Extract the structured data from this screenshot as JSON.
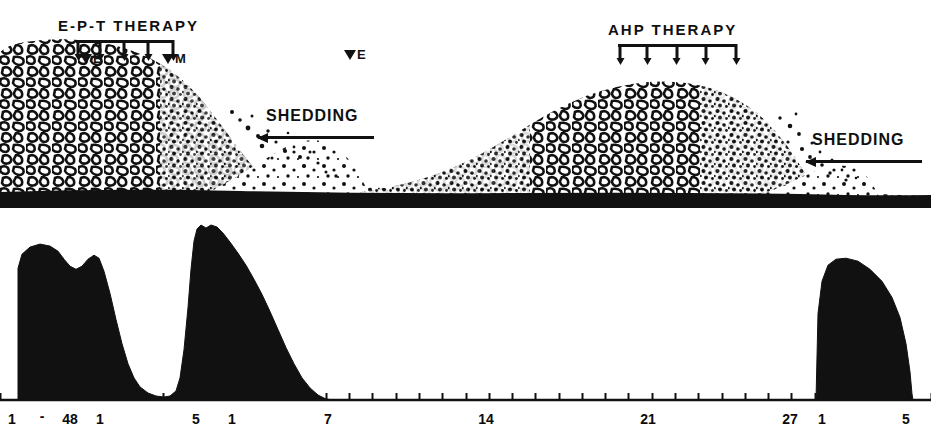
{
  "figure": {
    "title_hidden": "Vegetation mass and bacteremia time course",
    "ink_color": "#111111",
    "background_color": "#ffffff"
  },
  "annotations": {
    "therapy_left": {
      "label": "E-P-T THERAPY",
      "dose_count": 5,
      "start_day": 1,
      "end_day": 5
    },
    "therapy_right": {
      "label": "AHP THERAPY",
      "dose_count": 5,
      "start_day": 14,
      "end_day": 18
    },
    "shedding_left": {
      "label": "SHEDDING"
    },
    "shedding_right": {
      "label": "SHEDDING"
    },
    "markers": [
      {
        "name": "marker-e-left",
        "symbol": "▼",
        "text": "E"
      },
      {
        "name": "marker-m-left",
        "symbol": "▼",
        "text": "M"
      },
      {
        "name": "marker-e-mid",
        "symbol": "▼",
        "text": "E"
      }
    ]
  },
  "axis": {
    "orientation": "horizontal",
    "tick_count": 41,
    "labels": [
      {
        "text": "1",
        "x": 12
      },
      {
        "text": "-",
        "x": 42
      },
      {
        "text": "48",
        "x": 70
      },
      {
        "text": "1",
        "x": 100
      },
      {
        "text": "5",
        "x": 196
      },
      {
        "text": "1",
        "x": 232
      },
      {
        "text": "7",
        "x": 328
      },
      {
        "text": "14",
        "x": 486
      },
      {
        "text": "21",
        "x": 648
      },
      {
        "text": "27",
        "x": 790
      },
      {
        "text": "1",
        "x": 822
      },
      {
        "text": "5",
        "x": 906
      }
    ]
  },
  "chart_data": {
    "type": "area",
    "title": "",
    "xlabel": "",
    "ylabel": "",
    "grid": false,
    "legend": "none",
    "xlim": [
      0,
      931
    ],
    "ylim": [
      0,
      175
    ],
    "series": [
      {
        "name": "bacteremia-profile",
        "fill": "#111111",
        "points": [
          [
            18,
            0
          ],
          [
            18,
            131
          ],
          [
            22,
            145
          ],
          [
            30,
            152
          ],
          [
            40,
            155
          ],
          [
            50,
            153
          ],
          [
            58,
            148
          ],
          [
            64,
            140
          ],
          [
            70,
            133
          ],
          [
            76,
            130
          ],
          [
            82,
            133
          ],
          [
            88,
            140
          ],
          [
            94,
            144
          ],
          [
            99,
            141
          ],
          [
            104,
            128
          ],
          [
            110,
            106
          ],
          [
            116,
            80
          ],
          [
            122,
            56
          ],
          [
            128,
            36
          ],
          [
            134,
            22
          ],
          [
            140,
            13
          ],
          [
            148,
            7
          ],
          [
            156,
            4
          ],
          [
            164,
            3
          ],
          [
            170,
            4
          ],
          [
            176,
            9
          ],
          [
            180,
            22
          ],
          [
            184,
            50
          ],
          [
            188,
            92
          ],
          [
            191,
            130
          ],
          [
            194,
            158
          ],
          [
            197,
            170
          ],
          [
            201,
            174
          ],
          [
            206,
            171
          ],
          [
            211,
            174
          ],
          [
            217,
            172
          ],
          [
            223,
            166
          ],
          [
            230,
            157
          ],
          [
            238,
            146
          ],
          [
            246,
            134
          ],
          [
            254,
            120
          ],
          [
            262,
            105
          ],
          [
            270,
            88
          ],
          [
            278,
            70
          ],
          [
            286,
            52
          ],
          [
            294,
            36
          ],
          [
            302,
            22
          ],
          [
            310,
            12
          ],
          [
            318,
            5
          ],
          [
            326,
            1
          ],
          [
            334,
            0
          ],
          [
            816,
            0
          ],
          [
            818,
            86
          ],
          [
            822,
            118
          ],
          [
            828,
            134
          ],
          [
            836,
            140
          ],
          [
            846,
            141
          ],
          [
            858,
            138
          ],
          [
            870,
            130
          ],
          [
            882,
            118
          ],
          [
            892,
            102
          ],
          [
            900,
            82
          ],
          [
            906,
            56
          ],
          [
            910,
            28
          ],
          [
            912,
            6
          ],
          [
            913,
            0
          ]
        ]
      }
    ]
  },
  "vegetation": {
    "description": "Stippled illustration of bacterial vegetation: a large dense mound at the left that disperses to the right (shedding), a second growing mound in the middle-right that also disperses at the far right.",
    "baseline_color": "#111111"
  }
}
